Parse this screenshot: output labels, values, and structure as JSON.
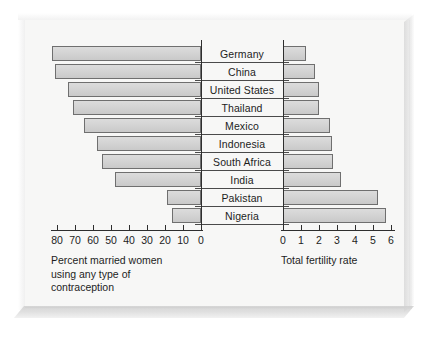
{
  "chart_data": {
    "type": "bar",
    "subtype": "back-to-back paired horizontal bar chart (population pyramid style)",
    "title": "",
    "categories": [
      "Germany",
      "China",
      "United States",
      "Thailand",
      "Mexico",
      "Indonesia",
      "South Africa",
      "India",
      "Pakistan",
      "Nigeria"
    ],
    "series": [
      {
        "name": "Percent married women using any type of contraception",
        "axis": "left",
        "direction": "right-to-left",
        "units": "percent",
        "values": [
          83,
          81,
          74,
          71,
          65,
          58,
          55,
          48,
          19,
          16
        ],
        "axis_label": "Percent married women\nusing any type of\ncontraception",
        "ticks": [
          80,
          70,
          60,
          50,
          40,
          30,
          20,
          10,
          0
        ],
        "tick_labels": [
          "80",
          "70",
          "60",
          "50",
          "40",
          "30",
          "20",
          "10",
          "0"
        ],
        "axis_range": [
          0,
          85
        ]
      },
      {
        "name": "Total fertility rate",
        "axis": "right",
        "direction": "left-to-right",
        "units": "births per woman",
        "values": [
          1.3,
          1.8,
          2.0,
          2.0,
          2.6,
          2.7,
          2.8,
          3.2,
          5.3,
          5.7
        ],
        "axis_label": "Total fertility rate",
        "ticks": [
          0,
          1,
          2,
          3,
          4,
          5,
          6
        ],
        "tick_labels": [
          "0",
          "1",
          "2",
          "3",
          "4",
          "5",
          "6"
        ],
        "axis_range": [
          0,
          6
        ]
      }
    ],
    "grid": false,
    "legend": "none",
    "colors": {
      "bar_fill": "#d4d4d4",
      "bar_stroke": "#6f6f6f",
      "axis": "#2e2e2e",
      "text": "#1d1d1d",
      "panel_background": "#f7f7f6",
      "frame": "#e9e9e9"
    }
  },
  "left_axis": {
    "caption": "Percent married women\nusing any type of\ncontraception",
    "tick_labels": [
      "80",
      "70",
      "60",
      "50",
      "40",
      "30",
      "20",
      "10",
      "0"
    ]
  },
  "right_axis": {
    "caption": "Total fertility rate",
    "tick_labels": [
      "0",
      "1",
      "2",
      "3",
      "4",
      "5",
      "6"
    ]
  },
  "countries": [
    {
      "label": "Germany",
      "contraception": 83,
      "fertility": 1.3
    },
    {
      "label": "China",
      "contraception": 81,
      "fertility": 1.8
    },
    {
      "label": "United States",
      "contraception": 74,
      "fertility": 2.0
    },
    {
      "label": "Thailand",
      "contraception": 71,
      "fertility": 2.0
    },
    {
      "label": "Mexico",
      "contraception": 65,
      "fertility": 2.6
    },
    {
      "label": "Indonesia",
      "contraception": 58,
      "fertility": 2.7
    },
    {
      "label": "South Africa",
      "contraception": 55,
      "fertility": 2.8
    },
    {
      "label": "India",
      "contraception": 48,
      "fertility": 3.2
    },
    {
      "label": "Pakistan",
      "contraception": 19,
      "fertility": 5.3
    },
    {
      "label": "Nigeria",
      "contraception": 16,
      "fertility": 5.7
    }
  ]
}
